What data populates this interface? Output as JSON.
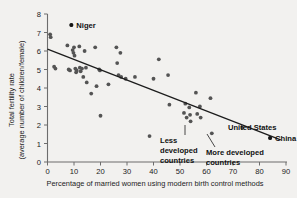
{
  "chart_data": {
    "type": "scatter",
    "title": "",
    "xlabel": "Percentage of married women using modern birth control methods",
    "ylabel_line1": "Total fertility rate",
    "ylabel_line2": "(average number of children/female)",
    "xlim": [
      0,
      90
    ],
    "ylim": [
      0,
      8
    ],
    "xticks": [
      0,
      10,
      20,
      30,
      40,
      50,
      60,
      70,
      80,
      90
    ],
    "yticks": [
      0,
      1,
      2,
      3,
      4,
      5,
      6,
      7,
      8
    ],
    "grid": false,
    "legend": "none",
    "series": [
      {
        "name": "Countries",
        "points": [
          [
            1.0,
            6.9
          ],
          [
            1.2,
            6.75
          ],
          [
            2.5,
            5.15
          ],
          [
            3.0,
            5.05
          ],
          [
            7.5,
            6.3
          ],
          [
            8.0,
            5.0
          ],
          [
            8.5,
            4.95
          ],
          [
            9.0,
            7.4
          ],
          [
            9.5,
            6.05
          ],
          [
            9.8,
            5.9
          ],
          [
            10.0,
            6.2
          ],
          [
            10.2,
            5.75
          ],
          [
            10.5,
            5.05
          ],
          [
            10.8,
            4.85
          ],
          [
            11.0,
            4.95
          ],
          [
            12.0,
            6.25
          ],
          [
            12.2,
            5.1
          ],
          [
            12.5,
            4.9
          ],
          [
            13.0,
            5.05
          ],
          [
            13.5,
            4.6
          ],
          [
            14.0,
            6.0
          ],
          [
            14.5,
            5.1
          ],
          [
            14.8,
            4.3
          ],
          [
            16.5,
            3.7
          ],
          [
            18.0,
            6.2
          ],
          [
            18.5,
            4.1
          ],
          [
            19.5,
            5.0
          ],
          [
            19.8,
            4.95
          ],
          [
            20.0,
            2.5
          ],
          [
            23.0,
            4.2
          ],
          [
            26.0,
            6.2
          ],
          [
            26.3,
            5.35
          ],
          [
            26.8,
            4.7
          ],
          [
            27.5,
            5.9
          ],
          [
            27.8,
            4.6
          ],
          [
            29.5,
            4.5
          ],
          [
            33.0,
            4.6
          ],
          [
            38.5,
            1.4
          ],
          [
            40.0,
            4.5
          ],
          [
            42.0,
            5.55
          ],
          [
            45.5,
            4.7
          ],
          [
            46.0,
            3.1
          ],
          [
            51.5,
            2.65
          ],
          [
            52.0,
            3.15
          ],
          [
            52.5,
            2.4
          ],
          [
            53.5,
            2.95
          ],
          [
            53.8,
            2.55
          ],
          [
            54.0,
            2.2
          ],
          [
            56.0,
            3.75
          ],
          [
            56.5,
            2.6
          ],
          [
            57.5,
            3.0
          ],
          [
            57.8,
            2.4
          ],
          [
            61.5,
            3.45
          ],
          [
            62.0,
            1.55
          ],
          [
            73.5,
            1.85
          ],
          [
            84.0,
            1.3
          ]
        ]
      }
    ],
    "trendline": {
      "x0": 0,
      "y0": 6.1,
      "x1": 88,
      "y1": 1.2
    },
    "annotations": [
      {
        "label": "Niger",
        "x": 9.0,
        "y": 7.4,
        "marker": true
      },
      {
        "label_lines": [
          "Less",
          "developed",
          "countries"
        ],
        "points_to_x": 53.5,
        "points_to_y": 2.55
      },
      {
        "label_lines": [
          "More developed",
          "countries"
        ],
        "points_to_x": 62.0,
        "points_to_y": 1.55
      },
      {
        "label": "United States",
        "x": 73.5,
        "y": 1.85,
        "marker": false
      },
      {
        "label": "China",
        "x": 84.0,
        "y": 1.3,
        "marker": true
      }
    ]
  }
}
